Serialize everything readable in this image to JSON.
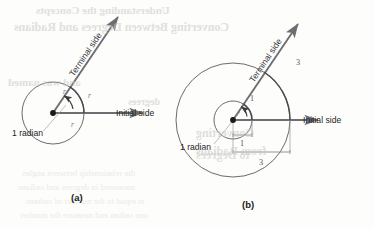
{
  "figure": {
    "panels": [
      {
        "id": "a",
        "caption": "(a)",
        "terminal_label": "Terminal side",
        "initial_label": "Initial side",
        "angle_label": "1 radian",
        "radius_labels": [
          "r",
          "r",
          "r"
        ],
        "arc_label": "r",
        "circle_radius_units": 1
      },
      {
        "id": "b",
        "caption": "(b)",
        "terminal_label": "Terminal side",
        "initial_label": "Initial side",
        "angle_label": "1 radian",
        "inner_arc_label": "1",
        "inner_radius_label": "1",
        "outer_arc_label": "3",
        "outer_radius_label": "3",
        "inner_circle_radius_units": 1,
        "outer_circle_radius_units": 3
      }
    ],
    "colors": {
      "line": "#6e6e72",
      "circle": "#5a5a5e",
      "text": "#1e1e1e",
      "label_gray": "#77777b",
      "background": "#fdfdfb",
      "bleed_text": "#c9c9c4"
    }
  },
  "bleedthrough": {
    "note": "faint mirrored text showing through from the reverse page",
    "lines": [
      {
        "text": "Understanding the Concepts",
        "x": 36,
        "y": 4,
        "size": 11,
        "weight": "bold"
      },
      {
        "text": "Converting Between Degrees and Radians",
        "x": 14,
        "y": 20,
        "size": 12,
        "weight": "bold"
      },
      {
        "text": "and was named",
        "x": 8,
        "y": 76,
        "size": 11,
        "weight": "bold"
      },
      {
        "text": "degrees",
        "x": 128,
        "y": 96,
        "size": 10,
        "weight": "bold"
      },
      {
        "text": "Converting",
        "x": 196,
        "y": 126,
        "size": 12,
        "weight": "bold"
      },
      {
        "text": "from Radians",
        "x": 196,
        "y": 144,
        "size": 12,
        "weight": "bold"
      },
      {
        "text": "to Degrees",
        "x": 196,
        "y": 148,
        "size": 12,
        "weight": "bold"
      },
      {
        "text": "the relationship between angles",
        "x": 22,
        "y": 168,
        "size": 9,
        "weight": "normal"
      },
      {
        "text": "measured in degrees and radians",
        "x": 18,
        "y": 182,
        "size": 9,
        "weight": "normal"
      },
      {
        "text": "is equal to the number of radians",
        "x": 26,
        "y": 196,
        "size": 9,
        "weight": "normal"
      },
      {
        "text": "one radian and measure the number",
        "x": 20,
        "y": 210,
        "size": 9,
        "weight": "normal"
      }
    ]
  }
}
